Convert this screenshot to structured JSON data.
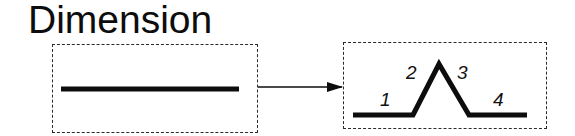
{
  "title": "Dimension",
  "colors": {
    "stroke": "#0d0d0d",
    "border": "#2a2a2a",
    "background": "#ffffff"
  },
  "source_box": {
    "shape": "straight-line"
  },
  "transform_arrow": {
    "direction": "right"
  },
  "target_box": {
    "shape": "line-with-peak",
    "segments": [
      {
        "label": "1"
      },
      {
        "label": "2"
      },
      {
        "label": "3"
      },
      {
        "label": "4"
      }
    ]
  }
}
